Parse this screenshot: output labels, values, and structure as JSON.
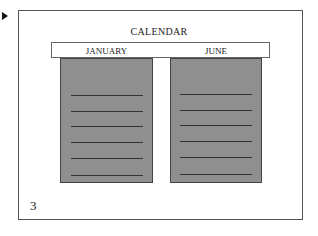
{
  "slide": {
    "title": "CALENDAR",
    "page_number": "3",
    "play_marker": "play-arrow"
  },
  "columns": [
    {
      "label": "JANUARY",
      "lines": 6
    },
    {
      "label": "JUNE",
      "lines": 6
    }
  ],
  "colors": {
    "panel_fill": "#8f8f8f",
    "panel_border": "#444444",
    "line": "#333333",
    "frame_border": "#555555",
    "background": "#ffffff"
  }
}
